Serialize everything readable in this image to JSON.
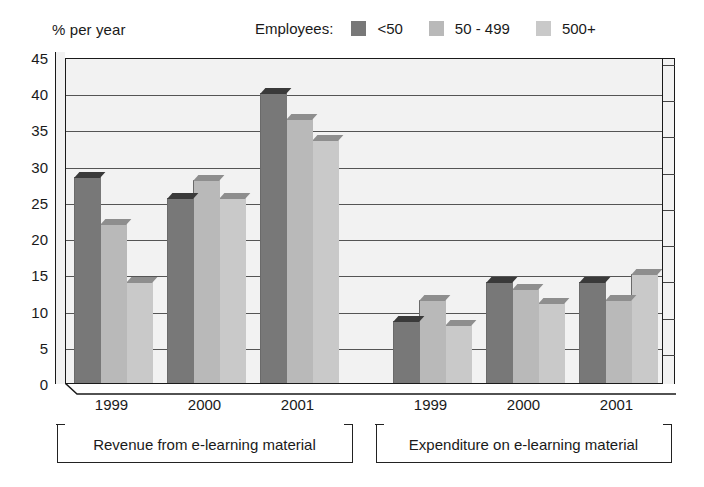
{
  "axis_unit_label": "% per year",
  "legend": {
    "title": "Employees:",
    "entries": [
      {
        "label": "<50",
        "color": "#787878"
      },
      {
        "label": "50 - 499",
        "color": "#b9b9b9"
      },
      {
        "label": "500+",
        "color": "#c9c9c9"
      }
    ]
  },
  "groups": [
    {
      "label": "Revenue from e-learning material"
    },
    {
      "label": "Expenditure on e-learning material"
    }
  ],
  "chart_data": {
    "type": "bar",
    "title": "",
    "subtitle": "",
    "xlabel": "",
    "ylabel": "% per year",
    "ylim": [
      0,
      45
    ],
    "yticks": [
      0,
      5,
      10,
      15,
      20,
      25,
      30,
      35,
      40,
      45
    ],
    "grid": true,
    "legend_position": "top-right",
    "legend_title": "Employees:",
    "categories": [
      "Revenue 1999",
      "Revenue 2000",
      "Revenue 2001",
      "Expenditure 1999",
      "Expenditure 2000",
      "Expenditure 2001"
    ],
    "category_years": [
      "1999",
      "2000",
      "2001",
      "1999",
      "2000",
      "2001"
    ],
    "panels": [
      {
        "name": "Revenue from e-learning material",
        "categories": [
          "1999",
          "2000",
          "2001"
        ]
      },
      {
        "name": "Expenditure on e-learning material",
        "categories": [
          "1999",
          "2000",
          "2001"
        ]
      }
    ],
    "series": [
      {
        "name": "<50",
        "color": "#787878",
        "values": [
          28.5,
          25.5,
          40.0,
          8.5,
          14.0,
          14.0
        ]
      },
      {
        "name": "50 - 499",
        "color": "#b9b9b9",
        "values": [
          22.0,
          28.0,
          36.5,
          11.5,
          13.0,
          11.5
        ]
      },
      {
        "name": "500+",
        "color": "#c9c9c9",
        "values": [
          14.0,
          25.5,
          33.5,
          8.0,
          11.0,
          15.0
        ]
      }
    ]
  }
}
